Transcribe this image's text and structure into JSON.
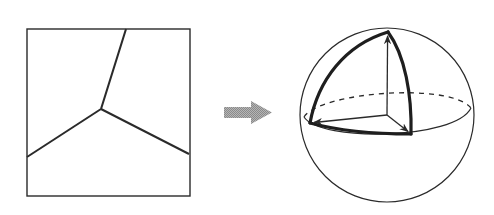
{
  "figure": {
    "colors": {
      "line": "#2a2a2a",
      "arrow": "#9a9a9a",
      "background": "#ffffff"
    },
    "left_panel": {
      "label": "square-with-triple-junction",
      "square": {
        "x": 27,
        "y": 29,
        "w": 163,
        "h": 167
      },
      "junction": {
        "x": 101,
        "y": 109
      },
      "branch_ends": [
        {
          "x": 126,
          "y": 29
        },
        {
          "x": 27,
          "y": 157
        },
        {
          "x": 189,
          "y": 154
        }
      ]
    },
    "transition_arrow": {
      "direction": "right"
    },
    "right_panel": {
      "label": "sphere-with-spherical-triangle",
      "sphere": {
        "cx": 387,
        "cy": 115,
        "r": 87
      },
      "triangle_vertices": {
        "top": {
          "x": 388,
          "y": 32
        },
        "left": {
          "x": 310,
          "y": 123
        },
        "right": {
          "x": 411,
          "y": 134
        }
      },
      "origin": {
        "x": 387,
        "y": 115
      }
    }
  }
}
